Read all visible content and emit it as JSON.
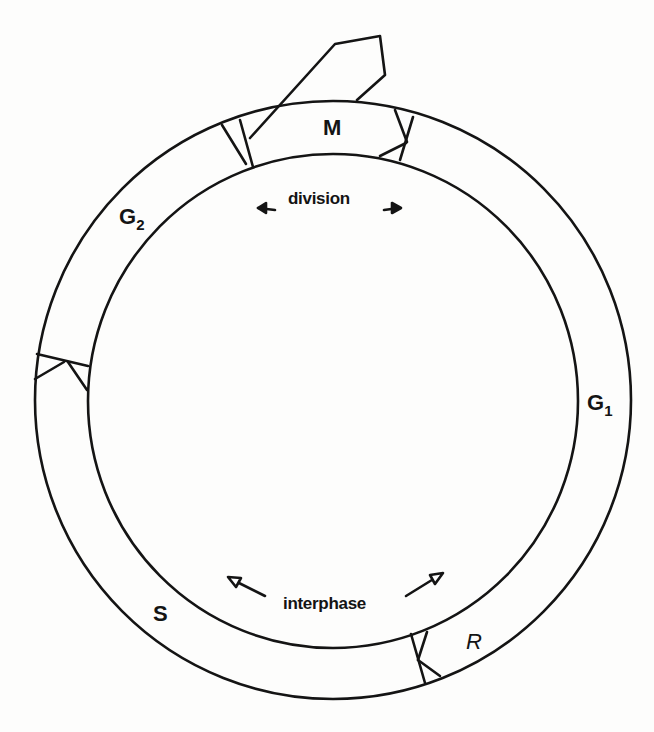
{
  "diagram": {
    "type": "cell-cycle",
    "colors": {
      "ink": "#141414",
      "paper": "#fdfdfc"
    },
    "rings": {
      "center": [
        333,
        400
      ],
      "outer_radius": 298,
      "inner_radius": 246
    },
    "phases": [
      {
        "id": "M",
        "label": "M",
        "subscript": ""
      },
      {
        "id": "G1",
        "label": "G",
        "subscript": "1"
      },
      {
        "id": "S",
        "label": "S",
        "subscript": ""
      },
      {
        "id": "G2",
        "label": "G",
        "subscript": "2"
      }
    ],
    "restriction_point": {
      "label": "R"
    },
    "zones": {
      "division": "division",
      "interphase": "interphase"
    },
    "arrows": {
      "division": "bidirectional",
      "interphase": "bidirectional"
    }
  }
}
